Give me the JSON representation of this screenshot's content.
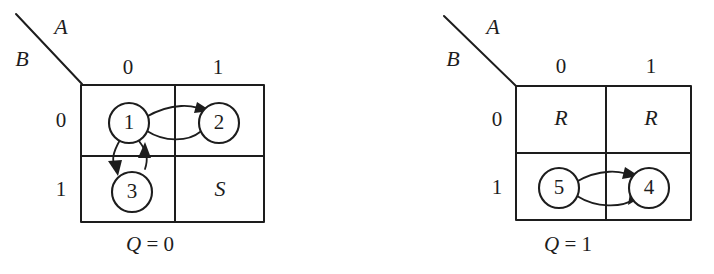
{
  "figure": {
    "background_color": "#ffffff",
    "ink_color": "#1d1d1d"
  },
  "panels": [
    {
      "id": "panel-q0",
      "axis_labels": {
        "column_var": "A",
        "row_var": "B"
      },
      "column_headers": [
        "0",
        "1"
      ],
      "row_headers": [
        "0",
        "1"
      ],
      "caption": {
        "variable": "Q",
        "equals": "=",
        "value": "0",
        "text": "Q = 0"
      },
      "cells": [
        {
          "row": "0",
          "col": "0",
          "content": "1",
          "kind": "state-node"
        },
        {
          "row": "0",
          "col": "1",
          "content": "2",
          "kind": "state-node"
        },
        {
          "row": "1",
          "col": "0",
          "content": "3",
          "kind": "state-node"
        },
        {
          "row": "1",
          "col": "1",
          "content": "S",
          "kind": "label"
        }
      ],
      "transitions": [
        {
          "from": "1",
          "to": "2",
          "style": "bidirectional-horizontal"
        },
        {
          "from": "1",
          "to": "3",
          "style": "bidirectional-vertical"
        }
      ]
    },
    {
      "id": "panel-q1",
      "axis_labels": {
        "column_var": "A",
        "row_var": "B"
      },
      "column_headers": [
        "0",
        "1"
      ],
      "row_headers": [
        "0",
        "1"
      ],
      "caption": {
        "variable": "Q",
        "equals": "=",
        "value": "1",
        "text": "Q = 1"
      },
      "cells": [
        {
          "row": "0",
          "col": "0",
          "content": "R",
          "kind": "label"
        },
        {
          "row": "0",
          "col": "1",
          "content": "R",
          "kind": "label"
        },
        {
          "row": "1",
          "col": "0",
          "content": "5",
          "kind": "state-node"
        },
        {
          "row": "1",
          "col": "1",
          "content": "4",
          "kind": "state-node"
        }
      ],
      "transitions": [
        {
          "from": "5",
          "to": "4",
          "style": "bidirectional-horizontal"
        }
      ]
    }
  ]
}
